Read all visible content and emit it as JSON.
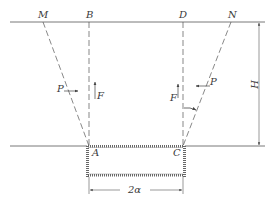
{
  "diagram": {
    "type": "trench-earth-pressure-schematic",
    "points": {
      "M": "M",
      "B": "B",
      "D": "D",
      "N": "N",
      "A": "A",
      "C": "C"
    },
    "forces": {
      "left_lateral": "P",
      "left_vertical": "F",
      "right_vertical": "F",
      "right_lateral": "P"
    },
    "dimensions": {
      "height": "H",
      "width": "2α"
    },
    "colors": {
      "line": "#555555",
      "text": "#3a3a3a",
      "background": "#ffffff"
    }
  }
}
